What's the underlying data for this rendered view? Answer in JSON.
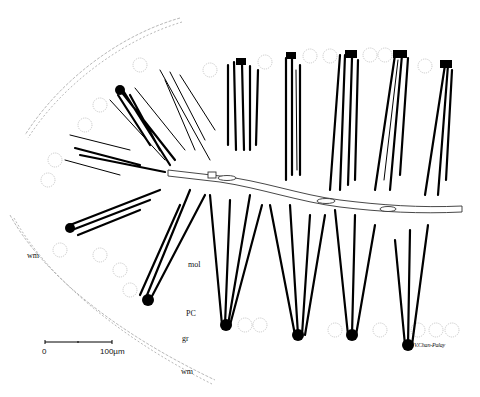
{
  "figure": {
    "type": "line-drawing",
    "labels": {
      "wm_left": "wm",
      "mol": "mol",
      "pc": "PC",
      "gr": "gr",
      "wm_bottom": "wm"
    },
    "scale_bar": {
      "start_label": "0",
      "end_label": "100µm"
    },
    "signature": "V.Chan-Palay",
    "colors": {
      "ink": "#000000",
      "background": "#ffffff",
      "faint_cells": "#bbbbbb"
    }
  }
}
